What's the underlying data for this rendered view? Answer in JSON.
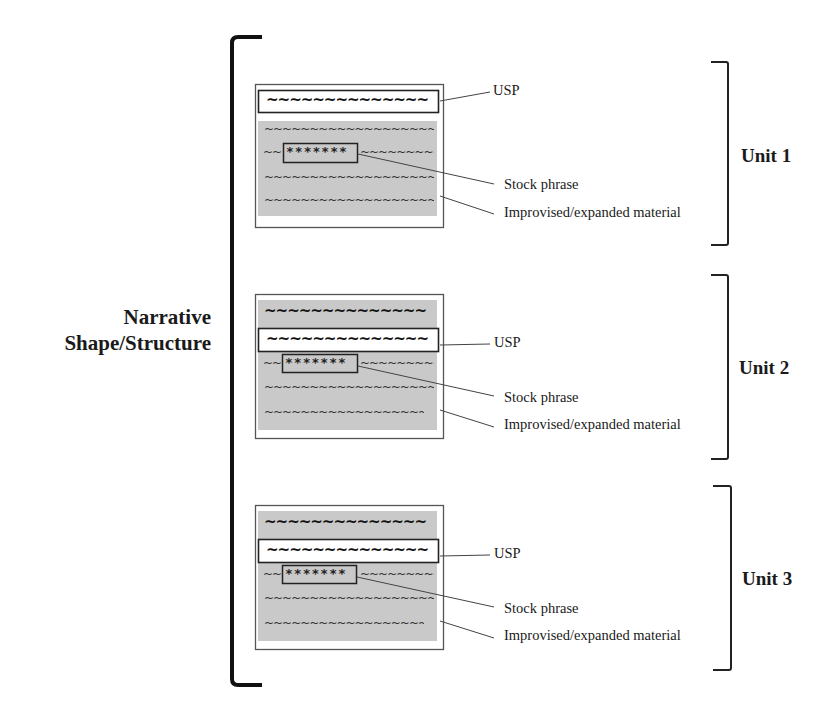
{
  "diagram": {
    "overall_label": {
      "line1": "Narrative",
      "line2": "Shape/Structure"
    },
    "colors": {
      "ink": "#1a1a1a",
      "gray_fill": "#c8c8c8",
      "box_stroke": "#444444",
      "background": "#ffffff"
    },
    "glyphs": {
      "wave_thin": "~~~~~~~~~~~~~~~~~~~~~",
      "wave_bold": "~~~~~~~~~~~~~~",
      "wave_short_left": "~~",
      "wave_short_right": "~~~~~~~~~~",
      "stars": "*******"
    },
    "units": [
      {
        "label": "Unit 1",
        "annotations": {
          "usp": "USP",
          "stock": "Stock phrase",
          "improvised": "Improvised/expanded material"
        },
        "layout": "usp-first"
      },
      {
        "label": "Unit 2",
        "annotations": {
          "usp": "USP",
          "stock": "Stock phrase",
          "improvised": "Improvised/expanded material"
        },
        "layout": "usp-second"
      },
      {
        "label": "Unit 3",
        "annotations": {
          "usp": "USP",
          "stock": "Stock phrase",
          "improvised": "Improvised/expanded material"
        },
        "layout": "usp-second"
      }
    ]
  }
}
